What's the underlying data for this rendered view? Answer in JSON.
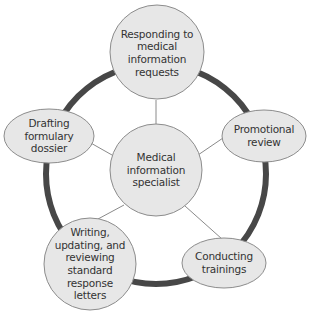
{
  "diagram": {
    "colors": {
      "ring": "#474747",
      "node_fill": "#e7e7e7",
      "node_stroke": "#8c8c8c",
      "connector": "#8a8a8a",
      "text": "#333333"
    },
    "center": {
      "label_lines": [
        "Medical",
        "information",
        "specialist"
      ]
    },
    "nodes": [
      {
        "id": "responding",
        "label_lines": [
          "Responding to",
          "medical",
          "information",
          "requests"
        ]
      },
      {
        "id": "promotional",
        "label_lines": [
          "Promotional",
          "review"
        ]
      },
      {
        "id": "conducting",
        "label_lines": [
          "Conducting",
          "trainings"
        ]
      },
      {
        "id": "writing",
        "label_lines": [
          "Writing,",
          "updating, and",
          "reviewing",
          "standard",
          "response",
          "letters"
        ]
      },
      {
        "id": "drafting",
        "label_lines": [
          "Drafting",
          "formulary",
          "dossier"
        ]
      }
    ]
  }
}
